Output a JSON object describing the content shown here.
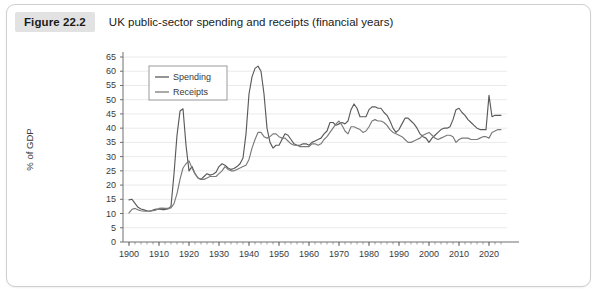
{
  "figure": {
    "number_label": "Figure 22.2",
    "title": "UK public-sector spending and receipts (financial years)"
  },
  "chart_data": {
    "type": "line",
    "title": "UK public-sector spending and receipts (financial years)",
    "xlabel": "",
    "ylabel": "% of GDP",
    "xlim": [
      1898,
      2026
    ],
    "ylim": [
      0,
      65
    ],
    "grid": true,
    "legend_position": "top-left-inside",
    "y_ticks": [
      0,
      5,
      10,
      15,
      20,
      25,
      30,
      35,
      40,
      45,
      50,
      55,
      60,
      65
    ],
    "x_ticks": [
      1900,
      1910,
      1920,
      1930,
      1940,
      1950,
      1960,
      1970,
      1980,
      1990,
      2000,
      2010,
      2020
    ],
    "colors": {
      "spending": "#5a5a5a",
      "receipts": "#7a7a7a",
      "gridline": "#eaeaea",
      "axis": "#6e6e6e"
    },
    "x": [
      1900,
      1901,
      1902,
      1903,
      1904,
      1905,
      1906,
      1907,
      1908,
      1909,
      1910,
      1911,
      1912,
      1913,
      1914,
      1915,
      1916,
      1917,
      1918,
      1919,
      1920,
      1921,
      1922,
      1923,
      1924,
      1925,
      1926,
      1927,
      1928,
      1929,
      1930,
      1931,
      1932,
      1933,
      1934,
      1935,
      1936,
      1937,
      1938,
      1939,
      1940,
      1941,
      1942,
      1943,
      1944,
      1945,
      1946,
      1947,
      1948,
      1949,
      1950,
      1951,
      1952,
      1953,
      1954,
      1955,
      1956,
      1957,
      1958,
      1959,
      1960,
      1961,
      1962,
      1963,
      1964,
      1965,
      1966,
      1967,
      1968,
      1969,
      1970,
      1971,
      1972,
      1973,
      1974,
      1975,
      1976,
      1977,
      1978,
      1979,
      1980,
      1981,
      1982,
      1983,
      1984,
      1985,
      1986,
      1987,
      1988,
      1989,
      1990,
      1991,
      1992,
      1993,
      1994,
      1995,
      1996,
      1997,
      1998,
      1999,
      2000,
      2001,
      2002,
      2003,
      2004,
      2005,
      2006,
      2007,
      2008,
      2009,
      2010,
      2011,
      2012,
      2013,
      2014,
      2015,
      2016,
      2017,
      2018,
      2019,
      2020,
      2021,
      2022,
      2023,
      2024
    ],
    "series": [
      {
        "name": "Spending",
        "values": [
          14.8,
          15.0,
          13.6,
          12.2,
          11.6,
          11.3,
          11.0,
          10.8,
          11.2,
          11.6,
          11.5,
          11.4,
          11.4,
          11.6,
          12.5,
          24.0,
          37.5,
          46.0,
          46.8,
          34.0,
          25.0,
          26.5,
          24.0,
          22.5,
          22.0,
          23.0,
          24.0,
          23.5,
          23.8,
          24.5,
          26.5,
          27.5,
          27.0,
          26.0,
          25.5,
          25.8,
          26.5,
          27.5,
          29.5,
          38.0,
          52.0,
          58.0,
          61.0,
          61.8,
          60.0,
          52.0,
          40.0,
          35.0,
          33.0,
          34.0,
          34.0,
          36.0,
          38.0,
          37.5,
          36.0,
          34.5,
          34.0,
          34.0,
          34.5,
          34.5,
          34.0,
          35.0,
          35.5,
          36.0,
          36.5,
          38.0,
          39.0,
          42.0,
          42.0,
          41.0,
          41.5,
          42.0,
          41.5,
          42.5,
          46.5,
          48.5,
          47.0,
          44.0,
          44.0,
          44.0,
          46.5,
          47.5,
          47.5,
          47.0,
          47.0,
          45.5,
          44.5,
          42.5,
          40.0,
          38.5,
          39.5,
          41.5,
          43.5,
          43.5,
          42.5,
          41.5,
          40.0,
          38.0,
          37.0,
          36.5,
          35.0,
          36.5,
          37.5,
          38.5,
          39.5,
          40.0,
          40.0,
          40.5,
          43.0,
          46.5,
          47.0,
          45.5,
          44.5,
          43.0,
          42.0,
          41.0,
          40.0,
          39.5,
          39.5,
          39.5,
          51.5,
          44.0,
          44.5,
          44.5,
          44.5
        ]
      },
      {
        "name": "Receipts",
        "values": [
          10.2,
          11.5,
          11.8,
          11.3,
          11.0,
          10.8,
          10.8,
          10.9,
          11.0,
          11.2,
          11.8,
          11.9,
          11.8,
          11.8,
          12.0,
          13.5,
          17.0,
          22.0,
          26.0,
          27.5,
          28.5,
          26.0,
          24.0,
          22.5,
          22.0,
          22.0,
          22.5,
          23.0,
          23.0,
          23.0,
          24.0,
          25.0,
          26.5,
          25.5,
          25.0,
          25.0,
          25.5,
          26.0,
          26.5,
          27.0,
          29.0,
          33.0,
          36.0,
          38.5,
          38.5,
          37.0,
          36.5,
          37.0,
          38.0,
          38.0,
          37.0,
          36.5,
          36.5,
          35.5,
          34.5,
          34.0,
          34.0,
          33.5,
          33.5,
          33.5,
          33.5,
          34.5,
          34.5,
          34.0,
          34.5,
          36.0,
          37.0,
          38.5,
          40.0,
          41.5,
          42.5,
          41.0,
          39.0,
          38.0,
          40.5,
          40.5,
          40.0,
          39.5,
          38.5,
          39.0,
          40.5,
          42.5,
          43.0,
          42.5,
          42.5,
          42.0,
          41.0,
          39.5,
          38.5,
          38.0,
          37.5,
          37.0,
          36.0,
          35.0,
          35.0,
          35.5,
          36.0,
          36.5,
          37.5,
          38.0,
          38.5,
          37.5,
          36.5,
          36.0,
          36.5,
          37.0,
          37.5,
          37.5,
          37.0,
          35.0,
          36.0,
          36.5,
          36.5,
          36.5,
          36.0,
          36.0,
          36.0,
          36.5,
          37.0,
          37.0,
          36.5,
          38.5,
          39.0,
          39.5,
          39.5
        ]
      }
    ]
  },
  "legend": {
    "items": [
      {
        "label": "Spending",
        "color": "#5a5a5a"
      },
      {
        "label": "Receipts",
        "color": "#7a7a7a"
      }
    ]
  },
  "axes": {
    "y_title": "% of GDP",
    "y_tick_labels": [
      "0",
      "5",
      "10",
      "15",
      "20",
      "25",
      "30",
      "35",
      "40",
      "45",
      "50",
      "55",
      "60",
      "65"
    ],
    "x_tick_labels": [
      "1900",
      "1910",
      "1920",
      "1930",
      "1940",
      "1950",
      "1960",
      "1970",
      "1980",
      "1990",
      "2000",
      "2010",
      "2020"
    ]
  }
}
